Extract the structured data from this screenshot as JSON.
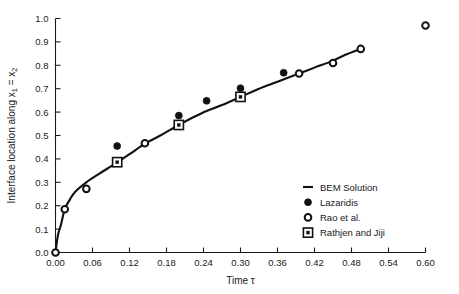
{
  "chart_data": {
    "type": "scatter",
    "title": "",
    "xlabel": "Time τ",
    "ylabel": "Interface location along x₁ = x₂",
    "ylabel_parts": {
      "prefix": "Interface location along x",
      "sub1": "1",
      "middle": " = x",
      "sub2": "2"
    },
    "xlim": [
      0.0,
      0.6
    ],
    "ylim": [
      0.0,
      1.0
    ],
    "xticks": [
      0.0,
      0.06,
      0.12,
      0.18,
      0.24,
      0.3,
      0.36,
      0.42,
      0.48,
      0.54,
      0.6
    ],
    "xtick_labels": [
      "0.00",
      "0.06",
      "0.12",
      "0.18",
      "0.24",
      "0.30",
      "0.36",
      "0.42",
      "0.48",
      "0.54",
      "0.60"
    ],
    "yticks": [
      0.0,
      0.1,
      0.2,
      0.3,
      0.4,
      0.5,
      0.6,
      0.7,
      0.8,
      0.9,
      1.0
    ],
    "ytick_labels": [
      "0.0",
      "0.1",
      "0.2",
      "0.3",
      "0.4",
      "0.5",
      "0.6",
      "0.7",
      "0.8",
      "0.9",
      "1.0"
    ],
    "grid": false,
    "legend_position": "lower-right-inside",
    "series": [
      {
        "name": "BEM Solution",
        "marker": "line",
        "style": "solid-line",
        "x": [
          0.0,
          0.004,
          0.009,
          0.015,
          0.023,
          0.032,
          0.05,
          0.07,
          0.085,
          0.1,
          0.12,
          0.145,
          0.17,
          0.2,
          0.225,
          0.245,
          0.27,
          0.3,
          0.33,
          0.36,
          0.395,
          0.42,
          0.45,
          0.47,
          0.495
        ],
        "y": [
          0.0,
          0.075,
          0.12,
          0.185,
          0.225,
          0.26,
          0.3,
          0.335,
          0.36,
          0.385,
          0.42,
          0.465,
          0.5,
          0.545,
          0.58,
          0.605,
          0.63,
          0.665,
          0.7,
          0.73,
          0.765,
          0.79,
          0.82,
          0.845,
          0.87
        ]
      },
      {
        "name": "Lazaridis",
        "marker": "filled-circle",
        "x": [
          0.1,
          0.2,
          0.245,
          0.3,
          0.37
        ],
        "y": [
          0.455,
          0.585,
          0.648,
          0.702,
          0.768
        ]
      },
      {
        "name": "Rao et al.",
        "marker": "open-circle",
        "x": [
          0.0,
          0.015,
          0.05,
          0.145,
          0.395,
          0.45,
          0.495,
          0.6
        ],
        "y": [
          0.0,
          0.185,
          0.272,
          0.467,
          0.765,
          0.81,
          0.87,
          0.97
        ]
      },
      {
        "name": "Rathjen and Jiji",
        "marker": "square-dot",
        "x": [
          0.1,
          0.2,
          0.3
        ],
        "y": [
          0.386,
          0.545,
          0.665
        ]
      }
    ]
  },
  "legend": {
    "items": [
      {
        "label": "BEM Solution",
        "marker": "line-dash-icon"
      },
      {
        "label": "Lazaridis",
        "marker": "filled-circle-icon"
      },
      {
        "label": "Rao et al.",
        "marker": "open-circle-icon"
      },
      {
        "label": "Rathjen and Jiji",
        "marker": "square-dot-icon"
      }
    ]
  },
  "colors": {
    "ink": "#111111",
    "background": "#ffffff"
  }
}
